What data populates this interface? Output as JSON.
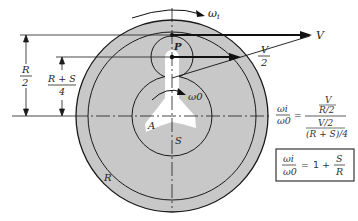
{
  "diagram": {
    "colors": {
      "gear_fill": "#c8c8c8",
      "line": "#1a1a1a",
      "background": "#ffffff",
      "carrier": "#ffffff"
    },
    "labels": {
      "omega_i": "ωi",
      "omega_i_sub": "i",
      "omega_o": "ω0",
      "velocity_full": "V",
      "velocity_half_num": "V",
      "velocity_half_den": "2",
      "planet": "P",
      "carrier": "A",
      "sun": "S",
      "ring": "R"
    },
    "dimensions": {
      "r_half": {
        "num": "R",
        "den": "2"
      },
      "rs_quarter": {
        "num": "R + S",
        "den": "4"
      }
    },
    "equations": {
      "eq1": {
        "lhs_num": "ωi",
        "lhs_den": "ω0",
        "equals": "=",
        "rhs_top_num": "V",
        "rhs_top_den": "R/2",
        "rhs_bot_num": "V/2",
        "rhs_bot_den": "(R + S)/4"
      },
      "eq2": {
        "lhs_num": "ωi",
        "lhs_den": "ω0",
        "equals": "=",
        "one_plus": "1 +",
        "frac_num": "S",
        "frac_den": "R"
      }
    }
  }
}
